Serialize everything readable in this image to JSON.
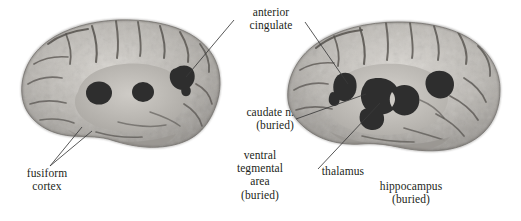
{
  "figure": {
    "background_color": "#ffffff",
    "text_color": "#231f20",
    "leader_line_color": "#3a3a3a",
    "blob_color": "#2e2e2e"
  },
  "labels": {
    "anterior_cingulate": {
      "lines": [
        "anterior",
        "cingulate"
      ],
      "line1": "anterior",
      "line2": "cingulate"
    },
    "fusiform_cortex": {
      "lines": [
        "fusiform",
        "cortex"
      ],
      "line1": "fusiform",
      "line2": "cortex"
    },
    "caudate_nucleus": {
      "lines": [
        "caudate n.",
        "(buried)"
      ],
      "line1": "caudate n.",
      "line2": "(buried)"
    },
    "ventral_tegmental_area": {
      "lines": [
        "ventral",
        "tegmental",
        "area",
        "(buried)"
      ],
      "line1": "ventral",
      "line2": "tegmental",
      "line3": "area",
      "line4": "(buried)"
    },
    "thalamus": {
      "lines": [
        "thalamus"
      ],
      "line1": "thalamus"
    },
    "hippocampus": {
      "lines": [
        "hippocampus",
        "(buried)"
      ],
      "line1": "hippocampus",
      "line2": "(buried)"
    }
  },
  "brains": {
    "left": {
      "name": "left-brain-medial-view",
      "regions": [
        "anterior cingulate",
        "caudate nucleus",
        "thalamus",
        "fusiform cortex"
      ]
    },
    "right": {
      "name": "right-brain-medial-view",
      "regions": [
        "anterior cingulate",
        "caudate nucleus",
        "thalamus",
        "hippocampus",
        "ventral tegmental area"
      ]
    }
  }
}
